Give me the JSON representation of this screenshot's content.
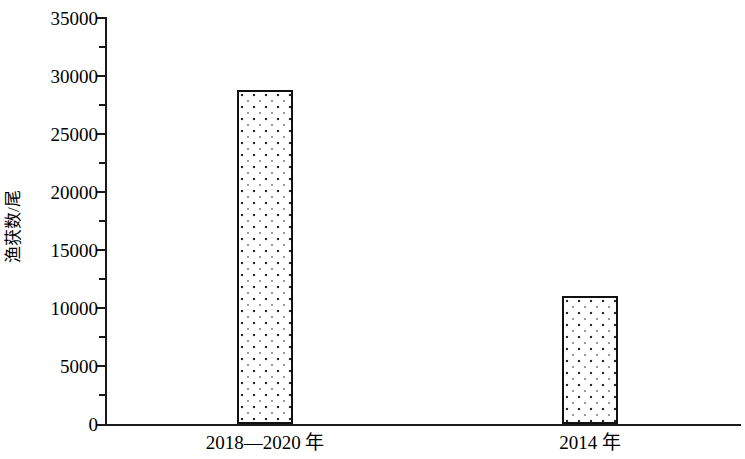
{
  "chart_data": {
    "type": "bar",
    "title": "",
    "subtitle": "",
    "xlabel": "",
    "ylabel": "渔获数/尾",
    "categories": [
      "2018—2020 年",
      "2014 年"
    ],
    "values": [
      28700,
      11000
    ],
    "series": [
      {
        "name": "渔获数",
        "values": [
          28700,
          11000
        ]
      }
    ],
    "ylim": [
      0,
      35000
    ],
    "y_major_ticks": [
      0,
      5000,
      10000,
      15000,
      20000,
      25000,
      30000,
      35000
    ],
    "y_tick_labels": [
      "0",
      "5000",
      "10000",
      "15000",
      "20000",
      "25000",
      "30000",
      "35000"
    ],
    "y_minor_ticks": [
      2500,
      7500,
      12500,
      17500,
      22500,
      27500,
      32500
    ],
    "grid": false,
    "legend": null,
    "legend_position": "none",
    "bar_fill": "dotted-pattern",
    "bar_edge_color": "#111111",
    "bar_face_color": "#ffffff",
    "axis_color": "#1a1a1a",
    "background_color": "#ffffff",
    "annotations": []
  },
  "axis": {
    "y_title": "渔获数/尾",
    "tick_labels": {
      "t0": "0",
      "t5000": "5000",
      "t10000": "10000",
      "t15000": "15000",
      "t20000": "20000",
      "t25000": "25000",
      "t30000": "30000",
      "t35000": "35000"
    }
  },
  "categories": {
    "c0": "2018—2020 年",
    "c1": "2014 年"
  }
}
